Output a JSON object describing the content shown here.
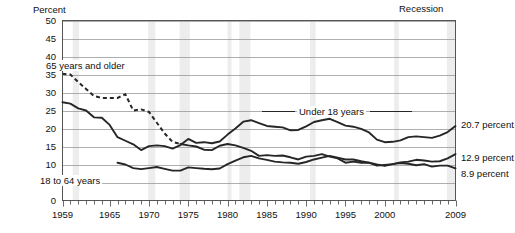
{
  "chart_data": {
    "type": "line",
    "title": "",
    "xlabel": "",
    "ylabel": "Percent",
    "ylim": [
      0,
      50
    ],
    "xlim": [
      1959,
      2009
    ],
    "ytick_labels": [
      "50",
      "45",
      "40",
      "35",
      "30",
      "25",
      "20",
      "15",
      "10",
      "5",
      "0"
    ],
    "ytick_values": [
      50,
      45,
      40,
      35,
      30,
      25,
      20,
      15,
      10,
      5,
      0
    ],
    "xtick_labels": [
      "1959",
      "1965",
      "1970",
      "1975",
      "1980",
      "1985",
      "1990",
      "1995",
      "2000",
      "2009"
    ],
    "xtick_values": [
      1959,
      1965,
      1970,
      1975,
      1980,
      1985,
      1990,
      1995,
      2000,
      2009
    ],
    "minor_xticks": "every year 1959-2009",
    "grid": "horizontal",
    "legend_position": "inline annotations",
    "annotations": [
      {
        "name": "recession-note",
        "text": "Recession"
      }
    ],
    "series": [
      {
        "name": "Under 18 years",
        "style": "solid",
        "end_label": "20.7 percent",
        "end_value": 20.7,
        "x": [
          1959,
          1960,
          1961,
          1962,
          1963,
          1964,
          1965,
          1966,
          1967,
          1968,
          1969,
          1970,
          1971,
          1972,
          1973,
          1974,
          1975,
          1976,
          1977,
          1978,
          1979,
          1980,
          1981,
          1982,
          1983,
          1984,
          1985,
          1986,
          1987,
          1988,
          1989,
          1990,
          1991,
          1992,
          1993,
          1994,
          1995,
          1996,
          1997,
          1998,
          1999,
          2000,
          2001,
          2002,
          2003,
          2004,
          2005,
          2006,
          2007,
          2008,
          2009
        ],
        "values": [
          27.3,
          26.9,
          25.6,
          25.0,
          23.1,
          23.0,
          21.0,
          17.6,
          16.6,
          15.6,
          14.0,
          15.1,
          15.3,
          15.1,
          14.4,
          15.4,
          17.1,
          16.0,
          16.2,
          15.9,
          16.4,
          18.3,
          20.0,
          21.9,
          22.3,
          21.5,
          20.7,
          20.5,
          20.3,
          19.5,
          19.6,
          20.6,
          21.8,
          22.3,
          22.7,
          21.8,
          20.8,
          20.5,
          19.9,
          18.9,
          16.9,
          16.2,
          16.3,
          16.7,
          17.6,
          17.8,
          17.6,
          17.4,
          18.0,
          19.0,
          20.7
        ]
      },
      {
        "name": "18 to 64 years",
        "style": "solid",
        "end_label": "12.9 percent",
        "end_value": 12.9,
        "x": [
          1966,
          1967,
          1968,
          1969,
          1970,
          1971,
          1972,
          1973,
          1974,
          1975,
          1976,
          1977,
          1978,
          1979,
          1980,
          1981,
          1982,
          1983,
          1984,
          1985,
          1986,
          1987,
          1988,
          1989,
          1990,
          1991,
          1992,
          1993,
          1994,
          1995,
          1996,
          1997,
          1998,
          1999,
          2000,
          2001,
          2002,
          2003,
          2004,
          2005,
          2006,
          2007,
          2008,
          2009
        ],
        "values": [
          10.5,
          10.0,
          9.0,
          8.7,
          9.0,
          9.3,
          8.8,
          8.3,
          8.3,
          9.2,
          9.0,
          8.8,
          8.7,
          8.9,
          10.1,
          11.1,
          12.0,
          12.4,
          11.7,
          11.3,
          10.8,
          10.6,
          10.5,
          10.2,
          10.7,
          11.4,
          11.9,
          12.4,
          11.9,
          11.4,
          11.4,
          10.9,
          10.5,
          10.0,
          9.6,
          10.1,
          10.6,
          10.8,
          11.3,
          11.1,
          10.8,
          10.9,
          11.7,
          12.9
        ]
      },
      {
        "name": "65 years and older",
        "style": "dashed-then-solid",
        "end_label": "8.9 percent",
        "end_value": 8.9,
        "x": [
          1959,
          1960,
          1961,
          1962,
          1963,
          1964,
          1965,
          1966,
          1967,
          1968,
          1969,
          1970,
          1971,
          1972,
          1973,
          1974,
          1975,
          1976,
          1977,
          1978,
          1979,
          1980,
          1981,
          1982,
          1983,
          1984,
          1985,
          1986,
          1987,
          1988,
          1989,
          1990,
          1991,
          1992,
          1993,
          1994,
          1995,
          1996,
          1997,
          1998,
          1999,
          2000,
          2001,
          2002,
          2003,
          2004,
          2005,
          2006,
          2007,
          2008,
          2009
        ],
        "values": [
          35.2,
          35.0,
          32.9,
          31.0,
          29.0,
          28.5,
          28.5,
          28.5,
          29.5,
          25.0,
          25.3,
          24.6,
          21.6,
          18.6,
          16.3,
          15.7,
          15.3,
          15.0,
          14.1,
          14.0,
          15.2,
          15.7,
          15.3,
          14.6,
          13.8,
          12.4,
          12.6,
          12.4,
          12.5,
          12.0,
          11.4,
          12.2,
          12.4,
          12.9,
          12.2,
          11.7,
          10.5,
          10.8,
          10.5,
          10.5,
          9.7,
          9.9,
          10.1,
          10.4,
          10.2,
          9.8,
          10.1,
          9.4,
          9.7,
          9.7,
          8.9
        ],
        "dashed_until": 1974
      }
    ]
  },
  "labels": {
    "percent_axis": "Percent",
    "recession": "Recession",
    "series_65": "65 years and older",
    "series_1864": "18 to 64 years",
    "series_u18": "Under 18 years",
    "end_u18": "20.7 percent",
    "end_1864": "12.9 percent",
    "end_65": "8.9 percent"
  },
  "colors": {
    "line": "#262626",
    "grid": "#8c8c8c",
    "frame": "#555555",
    "recession_band": "#ededed",
    "background": "#ffffff"
  }
}
